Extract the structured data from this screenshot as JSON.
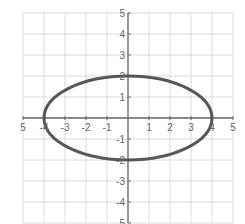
{
  "chart_data": {
    "type": "line",
    "title": "",
    "xlabel": "",
    "ylabel": "",
    "xlim": [
      -5,
      5
    ],
    "ylim": [
      -5,
      5
    ],
    "grid": true,
    "legend": null,
    "x_ticks": [
      "5",
      "-4",
      "-3",
      "-2",
      "-1",
      "1",
      "2",
      "3",
      "4",
      "5"
    ],
    "x_tick_values": [
      -5,
      -4,
      -3,
      -2,
      -1,
      1,
      2,
      3,
      4,
      5
    ],
    "y_ticks": [
      "5",
      "4",
      "3",
      "2",
      "1",
      "-1",
      "-2",
      "-3",
      "-4",
      "-5"
    ],
    "y_tick_values": [
      5,
      4,
      3,
      2,
      1,
      -1,
      -2,
      -3,
      -4,
      -5
    ],
    "series": [
      {
        "name": "ellipse",
        "equation": "x^2/16 + y^2/4 = 1",
        "center": [
          0,
          0
        ],
        "semi_major_x": 4,
        "semi_minor_y": 2,
        "vertices": [
          [
            -4,
            0
          ],
          [
            4,
            0
          ],
          [
            0,
            2
          ],
          [
            0,
            -2
          ]
        ]
      }
    ]
  },
  "colors": {
    "background": "#ffffff",
    "grid": "#dcdcdc",
    "axis": "#6a6a6a",
    "curve": "#575757",
    "labels": "#666666"
  }
}
